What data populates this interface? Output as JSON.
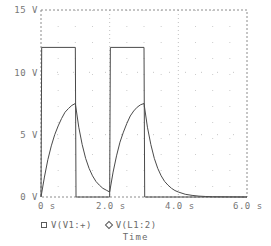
{
  "chart_data": {
    "type": "line",
    "title": "",
    "xlabel": "Time",
    "ylabel": "",
    "xlim": [
      0,
      6.0
    ],
    "ylim": [
      0,
      15
    ],
    "grid": true,
    "grid_style": "dotted",
    "legend_position": "bottom",
    "x_tick_labels": [
      "0 s",
      "2.0 s",
      "4.0 s",
      "6.0 s"
    ],
    "x_tick_values": [
      0,
      2.0,
      4.0,
      6.0
    ],
    "y_tick_labels": [
      "0 V",
      "5 V",
      "10 V",
      "15 V"
    ],
    "y_tick_values": [
      0,
      5,
      10,
      15
    ],
    "series": [
      {
        "name": "V(V1:+)",
        "marker": "square",
        "description": "Square wave pulse source, 12 V amplitude, 2 s period, 1 s pulse width",
        "points": [
          [
            0.0,
            0.0
          ],
          [
            0.02,
            12.0
          ],
          [
            1.0,
            12.0
          ],
          [
            1.02,
            0.0
          ],
          [
            2.0,
            0.0
          ],
          [
            2.02,
            12.0
          ],
          [
            3.0,
            12.0
          ],
          [
            3.02,
            0.0
          ],
          [
            6.0,
            0.0
          ]
        ]
      },
      {
        "name": "V(L1:2)",
        "marker": "diamond",
        "description": "Inductor/RC node voltage: exponential charge to 7.5 V then exponential decay",
        "points": [
          [
            0.0,
            0.0
          ],
          [
            0.1,
            1.6
          ],
          [
            0.2,
            3.0
          ],
          [
            0.3,
            4.1
          ],
          [
            0.4,
            5.0
          ],
          [
            0.5,
            5.7
          ],
          [
            0.6,
            6.3
          ],
          [
            0.7,
            6.8
          ],
          [
            0.8,
            7.1
          ],
          [
            0.9,
            7.35
          ],
          [
            1.0,
            7.5
          ],
          [
            1.1,
            5.6
          ],
          [
            1.2,
            4.2
          ],
          [
            1.3,
            3.1
          ],
          [
            1.4,
            2.3
          ],
          [
            1.5,
            1.7
          ],
          [
            1.6,
            1.25
          ],
          [
            1.7,
            0.95
          ],
          [
            1.8,
            0.7
          ],
          [
            1.9,
            0.55
          ],
          [
            2.0,
            0.4
          ],
          [
            2.1,
            2.0
          ],
          [
            2.2,
            3.3
          ],
          [
            2.3,
            4.4
          ],
          [
            2.4,
            5.2
          ],
          [
            2.5,
            5.9
          ],
          [
            2.6,
            6.5
          ],
          [
            2.7,
            6.9
          ],
          [
            2.8,
            7.2
          ],
          [
            2.9,
            7.4
          ],
          [
            3.0,
            7.5
          ],
          [
            3.1,
            5.6
          ],
          [
            3.2,
            4.2
          ],
          [
            3.3,
            3.1
          ],
          [
            3.4,
            2.3
          ],
          [
            3.5,
            1.7
          ],
          [
            3.6,
            1.25
          ],
          [
            3.7,
            0.95
          ],
          [
            3.8,
            0.7
          ],
          [
            3.9,
            0.52
          ],
          [
            4.0,
            0.4
          ],
          [
            4.2,
            0.22
          ],
          [
            4.4,
            0.13
          ],
          [
            4.6,
            0.07
          ],
          [
            4.8,
            0.04
          ],
          [
            5.0,
            0.02
          ],
          [
            5.5,
            0.01
          ],
          [
            6.0,
            0.0
          ]
        ]
      }
    ]
  },
  "axis": {
    "y_labels": [
      "15 V",
      "10 V",
      "5 V",
      "0 V"
    ],
    "x_labels": [
      "0 s",
      "2.0 s",
      "4.0 s",
      "6.0 s"
    ],
    "x_title": "Time"
  },
  "legend": {
    "entries": [
      {
        "marker": "square-marker",
        "label": "V(V1:+)"
      },
      {
        "marker": "diamond-marker",
        "label": "V(L1:2)"
      }
    ]
  },
  "colors": {
    "trace": "#4a4a4a",
    "frame": "#8c8c8c",
    "grid": "#b8b8b8",
    "text": "#6e6e6e",
    "background": "#ffffff"
  }
}
